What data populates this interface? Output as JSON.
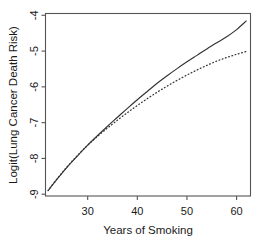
{
  "chart_data": {
    "type": "line",
    "title": "",
    "subtitle": "",
    "xlabel": "Years of Smoking",
    "ylabel": "Logit(Lung Cancer Death Risk)",
    "xlim": [
      21.5,
      62.8
    ],
    "ylim": [
      -9.05,
      -3.95
    ],
    "xticks": [
      30,
      40,
      50,
      60
    ],
    "yticks": [
      -4,
      -5,
      -6,
      -7,
      -8,
      -9
    ],
    "xtick_labels": [
      "30",
      "40",
      "50",
      "60"
    ],
    "ytick_labels": [
      "-4",
      "-5",
      "-6",
      "-7",
      "-8",
      "-9"
    ],
    "grid": false,
    "legend": "none",
    "box": true,
    "series": [
      {
        "name": "solid-curve",
        "style": "solid",
        "color": "#333333",
        "x": [
          22,
          24,
          26,
          28,
          30,
          32,
          34,
          36,
          38,
          40,
          42,
          44,
          46,
          48,
          50,
          52,
          54,
          56,
          58,
          60,
          62
        ],
        "y": [
          -8.9,
          -8.55,
          -8.22,
          -7.92,
          -7.63,
          -7.36,
          -7.1,
          -6.85,
          -6.6,
          -6.36,
          -6.13,
          -5.9,
          -5.69,
          -5.49,
          -5.3,
          -5.12,
          -4.94,
          -4.77,
          -4.6,
          -4.4,
          -4.15
        ]
      },
      {
        "name": "dotted-curve",
        "style": "dotted",
        "color": "#333333",
        "x": [
          22,
          24,
          26,
          28,
          30,
          32,
          34,
          36,
          38,
          40,
          42,
          44,
          46,
          48,
          50,
          52,
          54,
          56,
          58,
          60,
          62
        ],
        "y": [
          -8.9,
          -8.54,
          -8.21,
          -7.91,
          -7.63,
          -7.38,
          -7.15,
          -6.93,
          -6.72,
          -6.52,
          -6.33,
          -6.15,
          -5.98,
          -5.82,
          -5.67,
          -5.53,
          -5.4,
          -5.28,
          -5.18,
          -5.09,
          -5.01
        ]
      }
    ]
  }
}
